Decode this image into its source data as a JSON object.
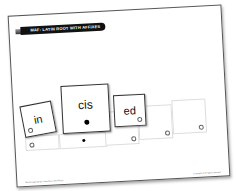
{
  "page": {
    "title": "MAF: LATIN ROOT WITH AFFIXES",
    "footer_left": "Morphology Cards • Latin Root with Affixes",
    "footer_right": "Copyright © All rights reserved."
  },
  "cards": [
    {
      "id": "prefix",
      "text": "in",
      "marker": "open"
    },
    {
      "id": "root",
      "text": "cis",
      "marker": "filled"
    },
    {
      "id": "suffix",
      "text": "ed",
      "marker": "open"
    }
  ],
  "slots": [
    {
      "marker": "open"
    },
    {
      "marker": "filled"
    },
    {
      "marker": "open"
    },
    {
      "marker": "open"
    },
    {
      "marker": "open"
    }
  ]
}
